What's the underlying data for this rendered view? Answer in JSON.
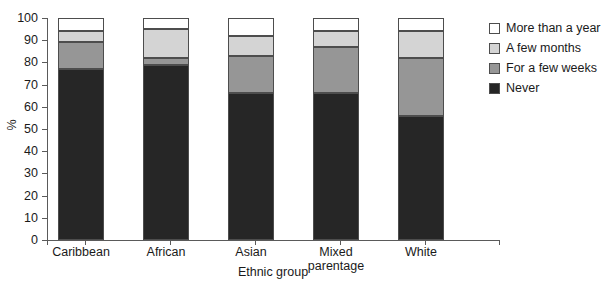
{
  "title": {
    "text": "",
    "cropped": true
  },
  "chart_data": {
    "type": "bar",
    "subtype": "stacked-column-100",
    "title": "",
    "xlabel": "Ethnic group",
    "ylabel": "%",
    "ylim": [
      0,
      100
    ],
    "yticks": [
      0,
      10,
      20,
      30,
      40,
      50,
      60,
      70,
      80,
      90,
      100
    ],
    "grid": false,
    "legend_position": "right",
    "categories": [
      "Caribbean",
      "African",
      "Asian",
      "Mixed parentage",
      "White"
    ],
    "series": [
      {
        "name": "Never",
        "color": "#262626",
        "values": [
          77,
          79,
          66,
          66,
          56
        ]
      },
      {
        "name": "For a few weeks",
        "color": "#969696",
        "values": [
          12,
          3,
          17,
          21,
          26
        ]
      },
      {
        "name": "A few months",
        "color": "#d4d4d4",
        "values": [
          5,
          13,
          9,
          7,
          12
        ]
      },
      {
        "name": "More than a year",
        "color": "#ffffff",
        "values": [
          6,
          5,
          8,
          6,
          6
        ]
      }
    ]
  },
  "axes": {
    "y_title": "%",
    "x_title": "Ethnic group",
    "y_tick_labels": [
      "100",
      "90",
      "80",
      "70",
      "60",
      "50",
      "40",
      "30",
      "20",
      "10",
      "0"
    ],
    "category_labels": [
      {
        "line1": "Caribbean",
        "line2": ""
      },
      {
        "line1": "African",
        "line2": ""
      },
      {
        "line1": "Asian",
        "line2": ""
      },
      {
        "line1": "Mixed",
        "line2": "parentage"
      },
      {
        "line1": "White",
        "line2": ""
      }
    ]
  },
  "legend": {
    "items": [
      {
        "label": "More than a year",
        "color": "#ffffff"
      },
      {
        "label": "A few months",
        "color": "#d4d4d4"
      },
      {
        "label": "For a few weeks",
        "color": "#969696"
      },
      {
        "label": "Never",
        "color": "#262626"
      }
    ]
  }
}
